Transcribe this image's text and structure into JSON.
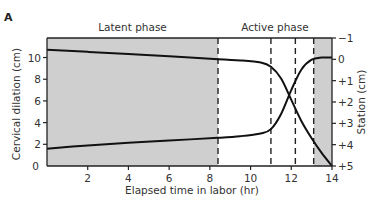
{
  "chart_data": {
    "type": "line",
    "panel_label": "A",
    "xlabel": "Elapsed time in labor (hr)",
    "ylabel": "Cervical dilation (cm)",
    "ylabel_right": "Station (cm)",
    "xlim": [
      0,
      14
    ],
    "ylim": [
      0,
      11.8
    ],
    "ylim_right": [
      -1,
      5
    ],
    "x_ticks": [
      2,
      4,
      6,
      8,
      10,
      12,
      14
    ],
    "x_tick_labels": [
      "2",
      "4",
      "6",
      "8",
      "10",
      "12",
      "14"
    ],
    "y_ticks": [
      0,
      2,
      4,
      6,
      8,
      10
    ],
    "y_tick_labels": [
      "0",
      "2",
      "4",
      "6",
      "8",
      "10"
    ],
    "y_right_ticks": [
      -1,
      0,
      1,
      2,
      3,
      4,
      5
    ],
    "y_right_tick_labels": [
      "−1",
      "0",
      "+1",
      "+2",
      "+3",
      "+4",
      "+5"
    ],
    "phases": [
      {
        "label": "Latent phase",
        "start": 0,
        "end": 8.4
      },
      {
        "label": "Active phase",
        "start": 8.4,
        "end": 14
      }
    ],
    "shaded_regions": [
      [
        0,
        8.4
      ],
      [
        13.1,
        14
      ]
    ],
    "dashed_lines_x": [
      8.4,
      11.0,
      12.2,
      13.1
    ],
    "series": [
      {
        "name": "Cervical dilation",
        "axis": "left",
        "x": [
          0,
          2,
          4,
          6,
          8.4,
          9.5,
          10.5,
          11,
          11.5,
          12,
          12.5,
          13,
          13.5,
          14
        ],
        "values": [
          1.6,
          1.9,
          2.15,
          2.35,
          2.6,
          2.75,
          3.0,
          3.4,
          4.8,
          7.0,
          8.9,
          9.8,
          10.0,
          10.0
        ]
      },
      {
        "name": "Station",
        "axis": "right",
        "x": [
          0,
          2,
          4,
          6,
          8.4,
          9.5,
          10.5,
          11,
          11.5,
          12,
          12.5,
          13,
          13.5,
          14
        ],
        "values": [
          -0.45,
          -0.35,
          -0.25,
          -0.15,
          0.0,
          0.05,
          0.15,
          0.35,
          0.9,
          1.9,
          2.9,
          3.7,
          4.4,
          5.0
        ]
      }
    ],
    "grid": false
  }
}
